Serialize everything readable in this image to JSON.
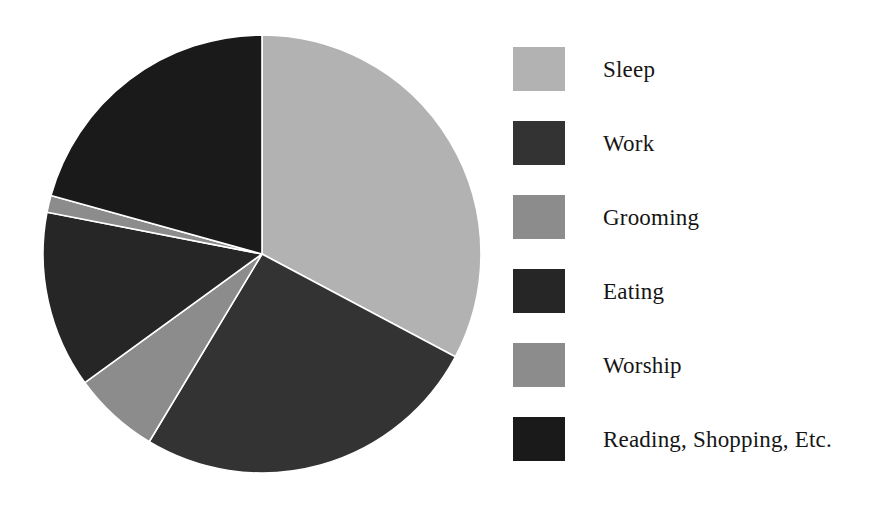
{
  "chart_data": {
    "type": "pie",
    "title": "",
    "subtitle": "",
    "xlabel": "",
    "ylabel": "",
    "legend_position": "right",
    "grid": false,
    "start_angle_deg": 0,
    "direction": "clockwise",
    "categories": [
      "Sleep",
      "Work",
      "Grooming",
      "Eating",
      "Worship",
      "Reading, Shopping, Etc."
    ],
    "values": [
      32.8,
      25.8,
      1.2,
      13.0,
      6.4,
      20.8
    ],
    "unit": "percent",
    "slices": [
      {
        "label": "Sleep",
        "value": 32.8,
        "color": "#b2b2b2",
        "start_deg": 0,
        "end_deg": 118.0
      },
      {
        "label": "Work",
        "value": 25.8,
        "color": "#333333",
        "start_deg": 118.0,
        "end_deg": 211.0
      },
      {
        "label": "Worship",
        "value": 6.4,
        "color": "#8c8c8c",
        "start_deg": 211.0,
        "end_deg": 234.0
      },
      {
        "label": "Eating",
        "value": 13.0,
        "color": "#262626",
        "start_deg": 234.0,
        "end_deg": 281.0
      },
      {
        "label": "Grooming",
        "value": 1.2,
        "color": "#8c8c8c",
        "start_deg": 281.0,
        "end_deg": 285.5
      },
      {
        "label": "Reading, Shopping, Etc.",
        "value": 20.8,
        "color": "#1a1a1a",
        "start_deg": 285.5,
        "end_deg": 360.0
      }
    ],
    "geometry": {
      "center_x": 220,
      "center_y": 220,
      "radius": 219
    },
    "separator_color": "#ffffff"
  },
  "legend": {
    "items": [
      {
        "label": "Sleep",
        "color": "#b2b2b2"
      },
      {
        "label": "Work",
        "color": "#333333"
      },
      {
        "label": "Grooming",
        "color": "#8c8c8c"
      },
      {
        "label": "Eating",
        "color": "#262626"
      },
      {
        "label": "Worship",
        "color": "#8c8c8c"
      },
      {
        "label": "Reading, Shopping, Etc.",
        "color": "#1a1a1a"
      }
    ]
  }
}
